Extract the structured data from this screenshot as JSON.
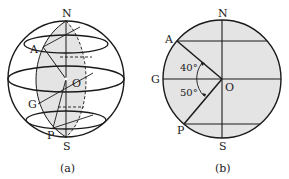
{
  "figure_a": {
    "caption": "(a)",
    "labels": {
      "north": "N",
      "south": "S",
      "center": "O",
      "point_a": "A",
      "point_g": "G",
      "point_p": "P"
    }
  },
  "figure_b": {
    "caption": "(b)",
    "labels": {
      "north": "N",
      "south": "S",
      "center": "O",
      "point_a": "A",
      "point_g": "G",
      "point_p": "P"
    },
    "angles": {
      "angle_aog": "40°",
      "angle_gop": "50°"
    }
  },
  "colors": {
    "stroke": "#1a1a1a",
    "shade": "#e4e4e4"
  }
}
